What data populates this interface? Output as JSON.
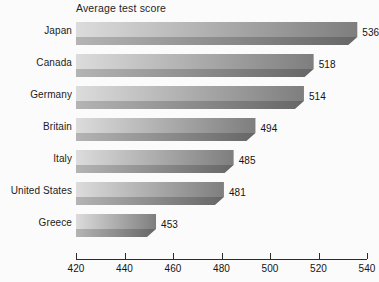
{
  "chart_data": {
    "type": "bar",
    "orientation": "horizontal",
    "title": "Average test score",
    "xlabel": "",
    "ylabel": "",
    "categories": [
      "Japan",
      "Canada",
      "Germany",
      "Britain",
      "Italy",
      "United States",
      "Greece"
    ],
    "values": [
      536,
      518,
      514,
      494,
      485,
      481,
      453
    ],
    "value_labels": [
      "536",
      "518",
      "514",
      "494",
      "485",
      "481",
      "453"
    ],
    "xlim": [
      420,
      540
    ],
    "xticks": [
      420,
      440,
      460,
      480,
      500,
      520,
      540
    ],
    "xtick_labels": [
      "420",
      "440",
      "460",
      "480",
      "500",
      "520",
      "540"
    ],
    "grid": false,
    "legend": false,
    "bar_style": "3d-extruded-gradient",
    "colors": {
      "background": "#fbfbfb",
      "bar_gradient_start": "#dcdcdc",
      "bar_gradient_end": "#7e7e7e",
      "bar_front_face_start": "#b4b4b4",
      "bar_front_face_end": "#666666",
      "axis": "#2b2b2b",
      "text": "#141414"
    }
  },
  "source_note": ""
}
